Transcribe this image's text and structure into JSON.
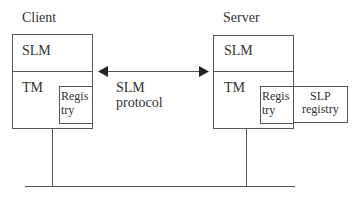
{
  "client": {
    "title": "Client",
    "top_section": "SLM",
    "bottom_section": "TM",
    "registry_line1": "Regis",
    "registry_line2": "try"
  },
  "server": {
    "title": "Server",
    "top_section": "SLM",
    "bottom_section": "TM",
    "registry_line1": "Regis",
    "registry_line2": "try",
    "slp_line1": "SLP",
    "slp_line2": "registry"
  },
  "protocol": {
    "line1": "SLM",
    "line2": "protocol"
  },
  "colors": {
    "stroke": "#555555",
    "text": "#333333",
    "background": "#ffffff"
  }
}
